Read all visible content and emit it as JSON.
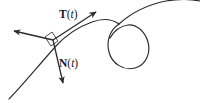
{
  "figure": {
    "title_alt": "Curve with unit tangent and unit normal vectors at a point",
    "background_color": "#ffffff",
    "stroke_color": "#2b2b2b",
    "labels": {
      "tangent": {
        "symbol": "T",
        "open_paren": "(",
        "param": "t",
        "close_paren": ")"
      },
      "normal": {
        "symbol": "N",
        "open_paren": "(",
        "param": "t",
        "close_paren": ")"
      }
    },
    "elements": {
      "curve_name": "space-curve-with-loop",
      "loop_name": "curve-loop",
      "tangent_arrow_name": "tangent-vector-arrow",
      "normal_arrow_name": "normal-vector-arrow",
      "binormal_arrow_name": "third-vector-arrow",
      "right_angle_name": "right-angle-marker",
      "point_name": "point-on-curve"
    }
  }
}
